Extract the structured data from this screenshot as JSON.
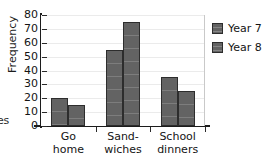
{
  "edge_fragment": "es",
  "chart_data": {
    "type": "bar",
    "title": "",
    "xlabel": "",
    "ylabel": "Frequency",
    "categories": [
      "Go home",
      "Sand-wiches",
      "School dinners"
    ],
    "category_lines": [
      [
        "Go",
        "home"
      ],
      [
        "Sand-",
        "wiches"
      ],
      [
        "School",
        "dinners"
      ]
    ],
    "series": [
      {
        "name": "Year 7",
        "values": [
          20,
          55,
          35
        ],
        "color": "#636363"
      },
      {
        "name": "Year 8",
        "values": [
          15,
          75,
          25
        ],
        "color": "#636363"
      }
    ],
    "ylim": [
      0,
      80
    ],
    "ytick_step": 10,
    "yticks": [
      0,
      10,
      20,
      30,
      40,
      50,
      60,
      70,
      80
    ],
    "ytick_labels": [
      "0",
      "10",
      "20",
      "30",
      "40",
      "50",
      "60",
      "70",
      "80"
    ],
    "grid": true,
    "grid_axis": "y",
    "legend_position": "right",
    "legend": [
      "Year 7",
      "Year 8"
    ]
  }
}
